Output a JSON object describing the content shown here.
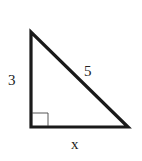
{
  "diagram": {
    "type": "right-triangle",
    "labels": {
      "vertical_leg": "3",
      "hypotenuse": "5",
      "horizontal_leg": "x"
    },
    "right_angle_marker": true,
    "colors": {
      "stroke": "#1a1a1a",
      "background": "#ffffff"
    }
  }
}
